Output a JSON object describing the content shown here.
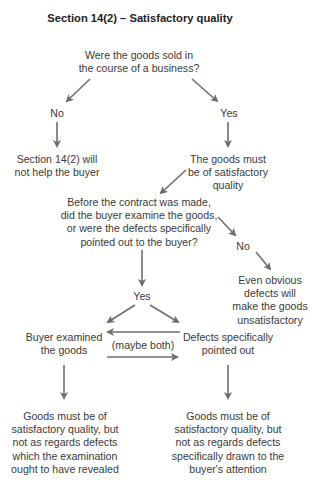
{
  "title": "Section 14(2) – Satisfactory quality",
  "colors": {
    "arrow": "#6e6e6e",
    "text": "#3a3a3a",
    "background": "#ffffff"
  },
  "nodes": {
    "q_business": [
      "Were the goods sold in",
      "the course of a business?"
    ],
    "no_help": [
      "Section 14(2) will",
      "not help the buyer"
    ],
    "must_be_satisfactory": [
      "The goods must",
      "be of satisfactory",
      "quality"
    ],
    "q_examine": [
      "Before the contract was made,",
      "did the buyer examine the goods,",
      "or were the defects specifically",
      "pointed out to the buyer?"
    ],
    "obvious_defects": [
      "Even obvious",
      "defects will",
      "make the goods",
      "unsatisfactory"
    ],
    "buyer_examined": [
      "Buyer examined",
      "the goods"
    ],
    "defects_pointed_out": [
      "Defects specifically",
      "pointed out"
    ],
    "outcome_examined": [
      "Goods must be of",
      "satisfactory quality, but",
      "not as regards defects",
      "which the examination",
      "ought to have revealed"
    ],
    "outcome_pointed_out": [
      "Goods must be of",
      "satisfactory quality, but",
      "not as regards defects",
      "specifically drawn to the",
      "buyer's attention"
    ]
  },
  "labels": {
    "no_1": "No",
    "yes_1": "Yes",
    "no_2": "No",
    "yes_2": "Yes",
    "maybe_both": "(maybe both)"
  }
}
